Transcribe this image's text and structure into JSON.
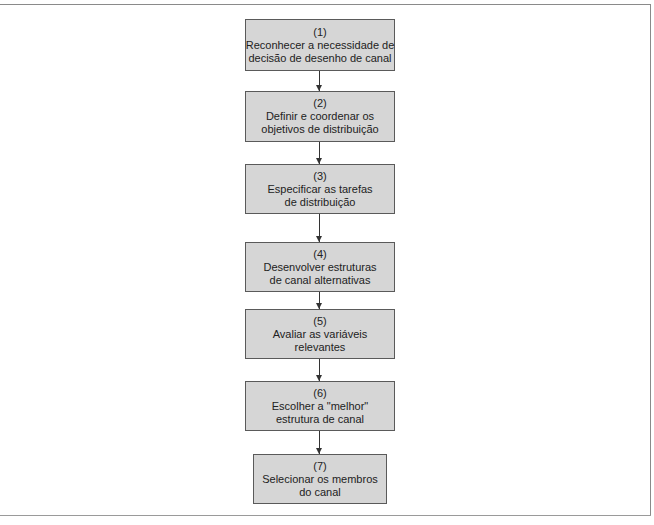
{
  "diagram": {
    "type": "flowchart",
    "direction": "top-to-bottom",
    "colors": {
      "box_fill": "#d6d6d6",
      "box_border": "#5a5a5a",
      "text": "#222222",
      "arrow": "#333333",
      "frame": "#8a8a8a"
    },
    "steps": [
      {
        "number": "(1)",
        "line1": "Reconhecer a necessidade de",
        "line2": "decisão de desenho de canal"
      },
      {
        "number": "(2)",
        "line1": "Definir e coordenar os",
        "line2": "objetivos de distribuição"
      },
      {
        "number": "(3)",
        "line1": "Especificar as tarefas",
        "line2": "de distribuição"
      },
      {
        "number": "(4)",
        "line1": "Desenvolver estruturas",
        "line2": "de canal alternativas"
      },
      {
        "number": "(5)",
        "line1": "Avaliar as variáveis",
        "line2": "relevantes"
      },
      {
        "number": "(6)",
        "line1": "Escolher a \"melhor\"",
        "line2": "estrutura de canal"
      },
      {
        "number": "(7)",
        "line1": "Selecionar os membros",
        "line2": "do canal"
      }
    ],
    "edges": [
      {
        "from": 1,
        "to": 2
      },
      {
        "from": 2,
        "to": 3
      },
      {
        "from": 3,
        "to": 4
      },
      {
        "from": 4,
        "to": 5
      },
      {
        "from": 5,
        "to": 6
      },
      {
        "from": 6,
        "to": 7
      }
    ]
  }
}
